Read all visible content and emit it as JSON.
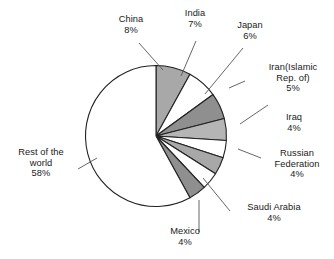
{
  "chart_data": {
    "type": "pie",
    "title": "",
    "xlabel": "",
    "ylabel": "",
    "legend": "none",
    "grid": false,
    "start_angle_deg": 0,
    "direction": "clockwise",
    "categories": [
      "China",
      "India",
      "Japan",
      "Iran(Islamic Rep. of)",
      "Iraq",
      "Russian Federation",
      "Saudi Arabia",
      "Mexico",
      "Rest of the world"
    ],
    "values": [
      8,
      7,
      6,
      5,
      4,
      4,
      4,
      4,
      58
    ],
    "value_labels": [
      "8%",
      "7%",
      "6%",
      "5%",
      "4%",
      "4%",
      "4%",
      "4%",
      "58%"
    ],
    "unit": "%",
    "slice_colors": [
      "#a8a8a8",
      "#ffffff",
      "#8f8f8f",
      "#b5b5b5",
      "#ffffff",
      "#a8a8a8",
      "#ffffff",
      "#8f8f8f",
      "#ffffff"
    ],
    "outline_color": "#222222"
  },
  "labels": [
    {
      "name": "China",
      "value": "8%",
      "key": "china"
    },
    {
      "name": "India",
      "value": "7%",
      "key": "india"
    },
    {
      "name": "Japan",
      "value": "6%",
      "key": "japan"
    },
    {
      "name": "Iran(Islamic",
      "name2": "Rep. of)",
      "value": "5%",
      "key": "iran"
    },
    {
      "name": "Iraq",
      "value": "4%",
      "key": "iraq"
    },
    {
      "name": "Russian",
      "name2": "Federation",
      "value": "4%",
      "key": "russian-federation"
    },
    {
      "name": "Saudi Arabia",
      "value": "4%",
      "key": "saudi-arabia"
    },
    {
      "name": "Mexico",
      "value": "4%",
      "key": "mexico"
    },
    {
      "name": "Rest of the",
      "name2": "world",
      "value": "58%",
      "key": "rest-of-the-world"
    }
  ],
  "label_text": {
    "china_name": "China",
    "china_value": "8%",
    "india_name": "India",
    "india_value": "7%",
    "japan_name": "Japan",
    "japan_value": "6%",
    "iran_name": "Iran(Islamic",
    "iran_name2": "Rep. of)",
    "iran_value": "5%",
    "iraq_name": "Iraq",
    "iraq_value": "4%",
    "russia_name": "Russian",
    "russia_name2": "Federation",
    "russia_value": "4%",
    "saudi_name": "Saudi Arabia",
    "saudi_value": "4%",
    "mexico_name": "Mexico",
    "mexico_value": "4%",
    "rest_name": "Rest of the",
    "rest_name2": "world",
    "rest_value": "58%"
  }
}
